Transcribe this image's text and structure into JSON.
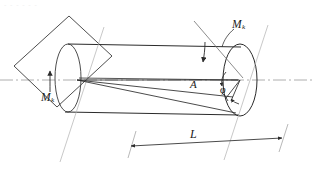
{
  "figure": {
    "caption_artifact": "- - - - - -",
    "colors": {
      "line": "#2b2b2b",
      "centerline": "#8a8a8a",
      "thin": "#555555",
      "background": "#ffffff"
    }
  },
  "labels": {
    "moment_right": {
      "symbol": "M",
      "subscript": "k"
    },
    "moment_left": {
      "symbol": "M",
      "subscript": "k"
    },
    "point_a": "A",
    "twist_angle": "φ",
    "length": "L"
  },
  "geometry": {
    "centerline": {
      "x1": 0,
      "y1": 80,
      "x2": 312,
      "y2": 80,
      "dash": "dash-dot"
    },
    "wall_plate": {
      "points": "14,66 69,16 112,56 57,107",
      "description": "rotated rectangular support plate"
    },
    "cylinder": {
      "top_edge": {
        "x1": 68,
        "y1": 44,
        "x2": 241,
        "y2": 47
      },
      "bottom_edge": {
        "x1": 65,
        "y1": 112,
        "x2": 239,
        "y2": 114
      },
      "left_end_rx": 13,
      "left_end_ry": 34,
      "left_end_cx": 68,
      "left_end_cy": 78,
      "right_end_rx": 17,
      "right_end_ry": 36,
      "right_end_cx": 240,
      "right_end_cy": 80
    },
    "dimension": {
      "label": "L",
      "line": {
        "x1": 131,
        "y1": 146,
        "x2": 282,
        "y2": 138
      },
      "arrows": "both"
    },
    "twist_lines": {
      "apex": {
        "x": 77,
        "y": 80
      },
      "targets": [
        {
          "x": 238,
          "y": 80
        },
        {
          "x": 232,
          "y": 96
        },
        {
          "x": 235,
          "y": 112
        }
      ]
    },
    "angle_arc": {
      "cx": 240,
      "cy": 80,
      "radius": 18
    }
  }
}
